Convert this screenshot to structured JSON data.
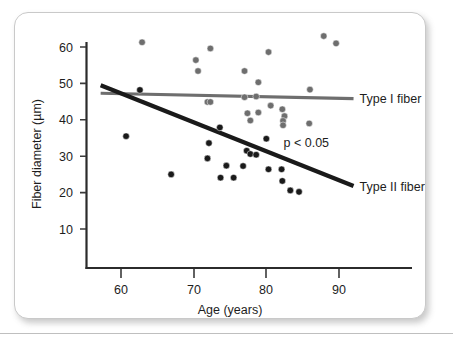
{
  "figure": {
    "background_color": "#ffffff",
    "card_border_color": "#c9c9c9"
  },
  "chart_data": {
    "type": "scatter",
    "title": "",
    "xlabel": "Age (years)",
    "ylabel": "Fiber diameter (µm)",
    "xlim": [
      56.5,
      95.5
    ],
    "ylim": [
      3,
      64
    ],
    "xticks": [
      60,
      70,
      80,
      90
    ],
    "xticklabels": [
      "60",
      "70",
      "80",
      "90"
    ],
    "yticks": [
      10,
      20,
      30,
      40,
      50,
      60
    ],
    "yticklabels": [
      "10",
      "20",
      "30",
      "40",
      "50",
      "60"
    ],
    "grid": false,
    "legend_position": "inline-right",
    "annotations": [
      {
        "text": "p < 0.05",
        "x": 85.5,
        "y": 32.5
      }
    ],
    "series": [
      {
        "name": "Type I fiber",
        "label": "Type I fiber",
        "color": "#6e6e6e",
        "marker": "circle",
        "points": [
          {
            "x": 62.9,
            "y": 61.3
          },
          {
            "x": 70.3,
            "y": 56.4
          },
          {
            "x": 70.6,
            "y": 53.4
          },
          {
            "x": 72.3,
            "y": 59.6
          },
          {
            "x": 77.0,
            "y": 53.4
          },
          {
            "x": 78.9,
            "y": 50.3
          },
          {
            "x": 80.3,
            "y": 58.6
          },
          {
            "x": 87.9,
            "y": 63.0
          },
          {
            "x": 89.6,
            "y": 61.0
          },
          {
            "x": 86.0,
            "y": 48.3
          },
          {
            "x": 71.9,
            "y": 44.9
          },
          {
            "x": 72.3,
            "y": 44.9
          },
          {
            "x": 77.0,
            "y": 46.2
          },
          {
            "x": 78.6,
            "y": 46.4
          },
          {
            "x": 80.6,
            "y": 43.9
          },
          {
            "x": 82.2,
            "y": 42.9
          },
          {
            "x": 77.4,
            "y": 41.8
          },
          {
            "x": 78.9,
            "y": 42.0
          },
          {
            "x": 77.8,
            "y": 39.8
          },
          {
            "x": 82.5,
            "y": 41.0
          },
          {
            "x": 82.3,
            "y": 39.7
          },
          {
            "x": 82.3,
            "y": 38.5
          },
          {
            "x": 85.9,
            "y": 39.0
          }
        ],
        "trendline": {
          "x_start": 57.2,
          "y_start": 47.3,
          "x_end": 92.0,
          "y_end": 45.8,
          "color": "#6e6e6e",
          "width": 3.2
        }
      },
      {
        "name": "Type II fiber",
        "label": "Type II fiber",
        "color": "#1a1a1a",
        "marker": "circle",
        "points": [
          {
            "x": 60.7,
            "y": 35.5
          },
          {
            "x": 62.6,
            "y": 48.2
          },
          {
            "x": 66.9,
            "y": 25.0
          },
          {
            "x": 72.1,
            "y": 33.6
          },
          {
            "x": 71.9,
            "y": 29.4
          },
          {
            "x": 73.6,
            "y": 37.9
          },
          {
            "x": 73.7,
            "y": 24.1
          },
          {
            "x": 74.5,
            "y": 27.4
          },
          {
            "x": 75.5,
            "y": 24.1
          },
          {
            "x": 76.8,
            "y": 27.3
          },
          {
            "x": 77.3,
            "y": 31.5
          },
          {
            "x": 77.8,
            "y": 30.6
          },
          {
            "x": 78.6,
            "y": 30.4
          },
          {
            "x": 80.0,
            "y": 34.8
          },
          {
            "x": 80.3,
            "y": 26.4
          },
          {
            "x": 82.1,
            "y": 26.4
          },
          {
            "x": 82.2,
            "y": 23.2
          },
          {
            "x": 83.3,
            "y": 20.6
          },
          {
            "x": 84.5,
            "y": 20.2
          }
        ],
        "trendline": {
          "x_start": 57.2,
          "y_start": 49.5,
          "x_end": 92.0,
          "y_end": 21.8,
          "color": "#1a1a1a",
          "width": 4.2
        }
      }
    ]
  }
}
